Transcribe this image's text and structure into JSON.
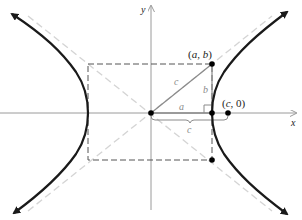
{
  "diagram": {
    "axes": {
      "x_label": "x",
      "y_label": "y"
    },
    "points": {
      "corner": {
        "label_open": "(",
        "a": "a",
        "comma": ", ",
        "b": "b",
        "label_close": ")"
      },
      "focus": {
        "label_open": "(",
        "c": "c",
        "comma": ", ",
        "zero": "0",
        "label_close": ")"
      }
    },
    "segments": {
      "hypotenuse_label": "c",
      "horizontal_label": "a",
      "vertical_label": "b",
      "brace_label": "c"
    },
    "colors": {
      "curve": "#1a1a1a",
      "axis": "#9a9a9a",
      "asymptote": "#d4d4d4",
      "rectangle": "#555555",
      "triangle": "#8a8a8a",
      "point": "#000000"
    }
  }
}
